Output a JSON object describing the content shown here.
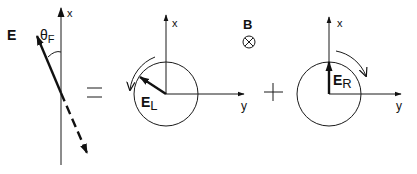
{
  "diagram": {
    "type": "vector-decomposition",
    "colors": {
      "ink": "#111111",
      "background": "#ffffff"
    },
    "left_panel": {
      "axis_label": "x",
      "vector_label": "E",
      "angle_label": "θ",
      "angle_subscript": "F"
    },
    "operators": {
      "equals": "=",
      "plus": "+"
    },
    "middle_panel": {
      "x_axis_label": "x",
      "y_axis_label": "y",
      "vector_label": "E",
      "vector_subscript": "L",
      "rotation": "counterclockwise"
    },
    "field": {
      "label": "B",
      "direction_symbol": "⊗",
      "direction": "into-page"
    },
    "right_panel": {
      "x_axis_label": "x",
      "y_axis_label": "y",
      "vector_label": "E",
      "vector_subscript": "R",
      "rotation": "clockwise"
    }
  }
}
